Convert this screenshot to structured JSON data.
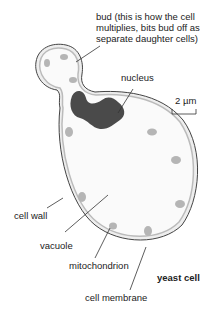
{
  "title": "yeast cell",
  "labels": {
    "bud_line1": "bud (this is how the cell",
    "bud_line2": "multiplies, bits bud off as",
    "bud_line3": "separate daughter cells)",
    "nucleus": "nucleus",
    "scale": "2 µm",
    "cell_wall": "cell wall",
    "vacuole": "vacuole",
    "mitochondrion": "mitochondrion",
    "cell_membrane": "cell membrane",
    "yeast_cell": "yeast cell"
  },
  "colors": {
    "cell_fill": "#f7f7f7",
    "cell_wall": "#bdbdbd",
    "outline": "#555555",
    "nucleus": "#4a4a4a",
    "mitochondrion": "#b0b0b0"
  }
}
